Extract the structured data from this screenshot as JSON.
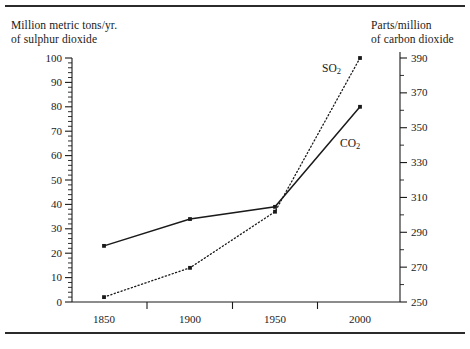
{
  "chart_data": {
    "type": "line",
    "title": "",
    "x": [
      1850,
      1900,
      1950,
      2000
    ],
    "xlabel": "",
    "xtick_labels": [
      "1850",
      "1900",
      "1950",
      "2000"
    ],
    "grid": false,
    "legend_position": "inline-at-line-end",
    "axes": [
      {
        "id": "left",
        "side": "left",
        "label": "Million metric tons/yr.\nof sulphur dioxide",
        "ylim": [
          0,
          100
        ],
        "major_step": 10,
        "minor_step": 2,
        "tick_labels": [
          "100",
          "90",
          "80",
          "70",
          "60",
          "50",
          "40",
          "30",
          "20",
          "10",
          "0"
        ],
        "ticks": [
          100,
          90,
          80,
          70,
          60,
          50,
          40,
          30,
          20,
          10,
          0
        ]
      },
      {
        "id": "right",
        "side": "right",
        "label": "Parts/million\nof carbon dioxide",
        "ylim": [
          250,
          390
        ],
        "major_step": 20,
        "minor_step": 10,
        "tick_labels": [
          "390",
          "370",
          "350",
          "330",
          "310",
          "290",
          "270",
          "250"
        ],
        "ticks": [
          390,
          370,
          350,
          330,
          310,
          290,
          270,
          250
        ]
      }
    ],
    "series": [
      {
        "name": "SO2",
        "label": "SO",
        "label_sub": "2",
        "axis": "left",
        "style": "dotted",
        "color": "#1a1a1a",
        "marker": "square",
        "values": [
          2,
          14,
          37,
          100
        ],
        "units": "million metric tons/yr."
      },
      {
        "name": "CO2",
        "label": "CO",
        "label_sub": "2",
        "axis": "right",
        "style": "solid",
        "color": "#1a1a1a",
        "marker": "square",
        "values": [
          283,
          298,
          305,
          370
        ],
        "values_left_scale": [
          23,
          34,
          39,
          80
        ],
        "units": "parts/million"
      }
    ],
    "annotations": [
      {
        "name": "so2-series-label",
        "text": "SO",
        "sub": "2",
        "x": 322,
        "y": 62
      },
      {
        "name": "co2-series-label",
        "text": "CO",
        "sub": "2",
        "x": 340,
        "y": 137
      }
    ]
  },
  "figure": {
    "left_caption": "Million metric tons/yr.\nof sulphur dioxide",
    "right_caption": "Parts/million\nof carbon dioxide"
  }
}
